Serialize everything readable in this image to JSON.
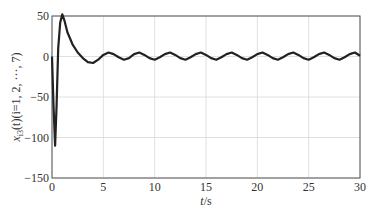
{
  "chart_data": {
    "type": "line",
    "title": "",
    "xlabel": "t/s",
    "ylabel": "x_i3(t)(i=1, 2, ···, 7)",
    "xlim": [
      0,
      30
    ],
    "ylim": [
      -150,
      50
    ],
    "xticks": [
      0,
      5,
      10,
      15,
      20,
      25,
      30
    ],
    "yticks": [
      -150,
      -100,
      -50,
      0,
      50
    ],
    "grid": true,
    "legend": null,
    "series": [
      {
        "name": "x_i3(t), i=1..7 (overlapping)",
        "color": "#222222",
        "x": [
          0,
          0.15,
          0.3,
          0.45,
          0.6,
          0.8,
          1.0,
          1.2,
          1.5,
          2.0,
          2.5,
          3.0,
          3.5,
          4.0,
          4.5,
          5.0,
          5.5,
          6.0,
          6.5,
          7.0,
          7.5,
          8.0,
          8.5,
          9.0,
          9.5,
          10.0,
          10.5,
          11.0,
          11.5,
          12.0,
          12.5,
          13.0,
          13.5,
          14.0,
          14.5,
          15.0,
          15.5,
          16.0,
          16.5,
          17.0,
          17.5,
          18.0,
          18.5,
          19.0,
          19.5,
          20.0,
          20.5,
          21.0,
          21.5,
          22.0,
          22.5,
          23.0,
          23.5,
          24.0,
          24.5,
          25.0,
          25.5,
          26.0,
          26.5,
          27.0,
          27.5,
          28.0,
          28.5,
          29.0,
          29.5,
          30.0
        ],
        "values": [
          0,
          -60,
          -110,
          -60,
          10,
          42,
          52,
          45,
          30,
          15,
          5,
          -2,
          -7,
          -8,
          -4,
          2,
          5,
          3,
          -1,
          -4,
          -2,
          3,
          5,
          2,
          -2,
          -4,
          -1,
          3,
          5,
          2,
          -2,
          -4,
          -1,
          3,
          5,
          2,
          -2,
          -4,
          -1,
          3,
          5,
          2,
          -2,
          -4,
          -1,
          3,
          5,
          2,
          -2,
          -4,
          -1,
          3,
          5,
          2,
          -2,
          -4,
          -1,
          3,
          5,
          2,
          -2,
          -4,
          -1,
          3,
          5,
          1
        ]
      }
    ]
  },
  "axes": {
    "x_label_main": "t",
    "x_label_unit": "/s",
    "y_label_var": "x",
    "y_label_sub": "i3",
    "y_label_rest": "(t)(i=1, 2, ···, 7)"
  }
}
